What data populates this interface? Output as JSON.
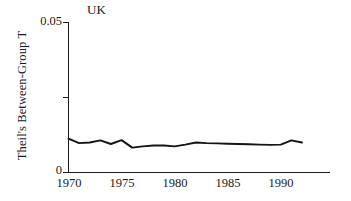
{
  "chart_data": {
    "type": "line",
    "title": "UK",
    "xlabel": "",
    "ylabel": "Theil's Between-Group T",
    "xlim": [
      1970,
      1992
    ],
    "ylim": [
      0,
      0.05
    ],
    "xticks": [
      1970,
      1975,
      1980,
      1985,
      1990
    ],
    "xtick_labels": [
      "1970",
      "1975",
      "1980",
      "1985",
      "1990"
    ],
    "yticks": [
      0,
      0.025,
      0.05
    ],
    "ytick_labels": [
      "0",
      "",
      "0.05"
    ],
    "grid": false,
    "legend": "none",
    "line_color": "#141414",
    "series": [
      {
        "name": "Theil's Between-Group T",
        "x": [
          1970,
          1971,
          1972,
          1973,
          1974,
          1975,
          1976,
          1977,
          1978,
          1979,
          1980,
          1981,
          1982,
          1983,
          1984,
          1985,
          1986,
          1987,
          1988,
          1989,
          1990,
          1991,
          1992
        ],
        "values": [
          0.0113,
          0.0098,
          0.01,
          0.0107,
          0.0095,
          0.0108,
          0.0083,
          0.0087,
          0.009,
          0.009,
          0.0087,
          0.0093,
          0.01,
          0.0098,
          0.0097,
          0.0096,
          0.0095,
          0.0094,
          0.0093,
          0.0092,
          0.0093,
          0.0107,
          0.01
        ]
      }
    ]
  },
  "axes": {
    "y_axis_title": "Theil's Between-Group T",
    "y_top_label": "0.05",
    "y_bottom_label": "0",
    "x_labels": [
      "1970",
      "1975",
      "1980",
      "1985",
      "1990"
    ]
  },
  "panel": {
    "label": "UK"
  }
}
